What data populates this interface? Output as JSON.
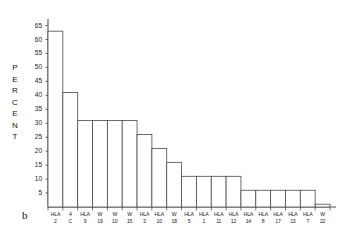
{
  "figure": {
    "panel_label": "b",
    "ylabel_letters": [
      "P",
      "E",
      "R",
      "C",
      "E",
      "N",
      "T"
    ]
  },
  "chart_data": {
    "type": "bar",
    "title": "",
    "xlabel": "",
    "ylabel": "PERCENT",
    "ylim": [
      0,
      67
    ],
    "yticks": [
      5,
      10,
      15,
      20,
      25,
      30,
      35,
      40,
      45,
      50,
      55,
      60,
      65
    ],
    "ytick_labels": [
      "5",
      "10",
      "15",
      "20",
      "25",
      "30",
      "35",
      "40",
      "45",
      "50",
      "55",
      "60",
      "65"
    ],
    "grid": false,
    "legend": null,
    "bar_color": "#ffffff",
    "bar_edge_color": "#4a4a4a",
    "axis_color": "#555555",
    "categories": [
      "HLA 2",
      "4 C",
      "HLA 9",
      "W 19",
      "W 10",
      "W 15",
      "HLA 3",
      "HLA 10",
      "W 18",
      "HLA 5",
      "HLA 1",
      "HLA 11",
      "HLA 12",
      "HLA 14",
      "HLA 8",
      "HLA 17",
      "HLA 13",
      "HLA 7",
      "W 22"
    ],
    "category_parts": [
      {
        "gene": "HLA",
        "num": "2"
      },
      {
        "gene": "4",
        "num": "C"
      },
      {
        "gene": "HLA",
        "num": "9"
      },
      {
        "gene": "W",
        "num": "19"
      },
      {
        "gene": "W",
        "num": "10"
      },
      {
        "gene": "W",
        "num": "15"
      },
      {
        "gene": "HLA",
        "num": "3"
      },
      {
        "gene": "HLA",
        "num": "10"
      },
      {
        "gene": "W",
        "num": "18"
      },
      {
        "gene": "HLA",
        "num": "5"
      },
      {
        "gene": "HLA",
        "num": "1"
      },
      {
        "gene": "HLA",
        "num": "11"
      },
      {
        "gene": "HLA",
        "num": "12"
      },
      {
        "gene": "HLA",
        "num": "14"
      },
      {
        "gene": "HLA",
        "num": "8"
      },
      {
        "gene": "HLA",
        "num": "17"
      },
      {
        "gene": "HLA",
        "num": "13"
      },
      {
        "gene": "HLA",
        "num": "7"
      },
      {
        "gene": "W",
        "num": "22"
      }
    ],
    "values": [
      63,
      41,
      31,
      31,
      31,
      31,
      26,
      21,
      16,
      11,
      11,
      11,
      11,
      6,
      6,
      6,
      6,
      6,
      1
    ]
  }
}
